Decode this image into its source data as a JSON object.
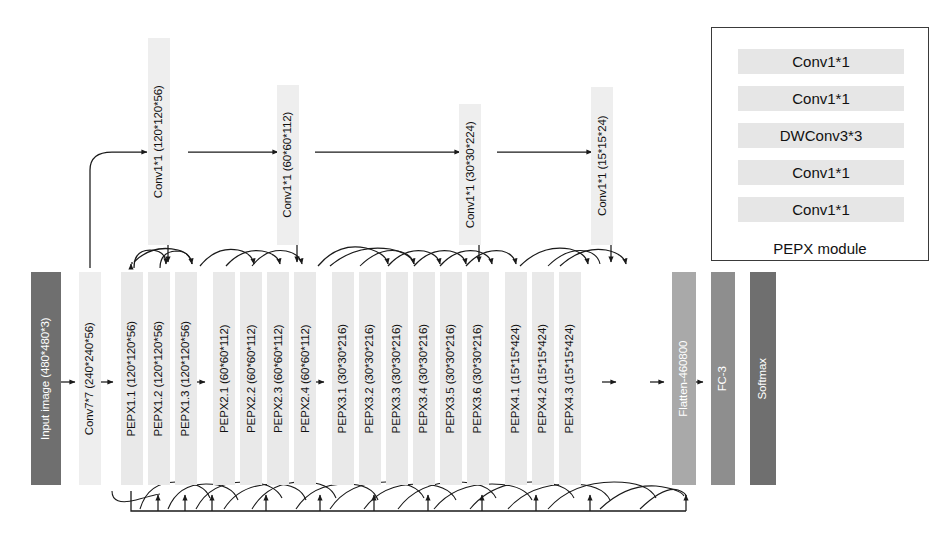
{
  "diagram": {
    "colors": {
      "block_light": "#eeeeee",
      "block_mid": "#a9a9a9",
      "block_dark": "#8e8e8e",
      "block_darkest": "#6f6f6f",
      "line": "#1a1a1a",
      "legend_block": "#e6e6e6"
    }
  },
  "input_block": {
    "label": "Input image (480*480*3)"
  },
  "stem_block": {
    "label": "Conv7*7 (240*240*56)"
  },
  "conv_projections": [
    {
      "label": "Conv1*1 (120*120*56)"
    },
    {
      "label": "Conv1*1 (60*60*112)"
    },
    {
      "label": "Conv1*1 (30*30*224)"
    },
    {
      "label": "Conv1*1 (15*15*24)"
    }
  ],
  "pepx_blocks": [
    {
      "label": "PEPX1.1 (120*120*56)"
    },
    {
      "label": "PEPX1.2 (120*120*56)"
    },
    {
      "label": "PEPX1.3 (120*120*56)"
    },
    {
      "label": "PEPX2.1 (60*60*112)"
    },
    {
      "label": "PEPX2.2 (60*60*112)"
    },
    {
      "label": "PEPX2.3 (60*60*112)"
    },
    {
      "label": "PEPX2.4 (60*60*112)"
    },
    {
      "label": "PEPX3.1 (30*30*216)"
    },
    {
      "label": "PEPX3.2 (30*30*216)"
    },
    {
      "label": "PEPX3.3 (30*30*216)"
    },
    {
      "label": "PEPX3.4 (30*30*216)"
    },
    {
      "label": "PEPX3.5 (30*30*216)"
    },
    {
      "label": "PEPX3.6 (30*30*216)"
    },
    {
      "label": "PEPX4.1 (15*15*424)"
    },
    {
      "label": "PEPX4.2 (15*15*424)"
    },
    {
      "label": "PEPX4.3 (15*15*424)"
    }
  ],
  "head_blocks": [
    {
      "label": "Flatten-460800"
    },
    {
      "label": "FC-3"
    },
    {
      "label": "Softmax"
    }
  ],
  "legend": {
    "rows": [
      {
        "label": "Conv1*1"
      },
      {
        "label": "Conv1*1"
      },
      {
        "label": "DWConv3*3"
      },
      {
        "label": "Conv1*1"
      },
      {
        "label": "Conv1*1"
      }
    ],
    "caption": "PEPX module"
  }
}
